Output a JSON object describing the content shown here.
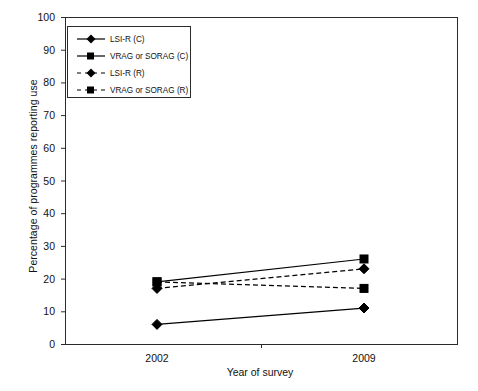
{
  "chart_data": {
    "type": "line",
    "title": "",
    "xlabel": "Year of survey",
    "ylabel": "Percentage of programmes reporting use",
    "categories": [
      "2002",
      "2009"
    ],
    "x": [
      2002,
      2009
    ],
    "ylim": [
      0,
      100
    ],
    "yticks": [
      0,
      10,
      20,
      30,
      40,
      50,
      60,
      70,
      80,
      90,
      100
    ],
    "ytick_labels": [
      "0",
      "10",
      "20",
      "30",
      "40",
      "50",
      "60",
      "70",
      "80",
      "90",
      "100"
    ],
    "grid": false,
    "legend_position": "upper-left-inside",
    "series": [
      {
        "name": "LSI-R (C)",
        "values": [
          6,
          11
        ],
        "marker": "diamond",
        "line_style": "solid",
        "color": "#000000"
      },
      {
        "name": "VRAG or SORAG (C)",
        "values": [
          19,
          26
        ],
        "marker": "square",
        "line_style": "solid",
        "color": "#000000"
      },
      {
        "name": "LSI-R (R)",
        "values": [
          17,
          23
        ],
        "marker": "diamond",
        "line_style": "dashed",
        "color": "#000000"
      },
      {
        "name": "VRAG or SORAG (R)",
        "values": [
          19,
          17
        ],
        "marker": "square",
        "line_style": "dashed",
        "color": "#000000"
      }
    ]
  },
  "axes": {
    "y_title": "Percentage of programmes reporting use",
    "x_title": "Year of survey",
    "y_labels": [
      "100",
      "90",
      "80",
      "70",
      "60",
      "50",
      "40",
      "30",
      "20",
      "10",
      "0"
    ],
    "x_labels": [
      "2002",
      "2009"
    ]
  },
  "legend": {
    "entries": [
      {
        "label": "LSI-R (C)",
        "marker": "diamond",
        "line_style": "solid"
      },
      {
        "label": "VRAG or SORAG (C)",
        "marker": "square",
        "line_style": "solid"
      },
      {
        "label": "LSI-R (R)",
        "marker": "diamond",
        "line_style": "dashed"
      },
      {
        "label": "VRAG or SORAG (R)",
        "marker": "square",
        "line_style": "dashed"
      }
    ]
  },
  "style": {
    "axis_color": "#2b2b2b",
    "series_color": "#000000",
    "background": "#ffffff"
  }
}
